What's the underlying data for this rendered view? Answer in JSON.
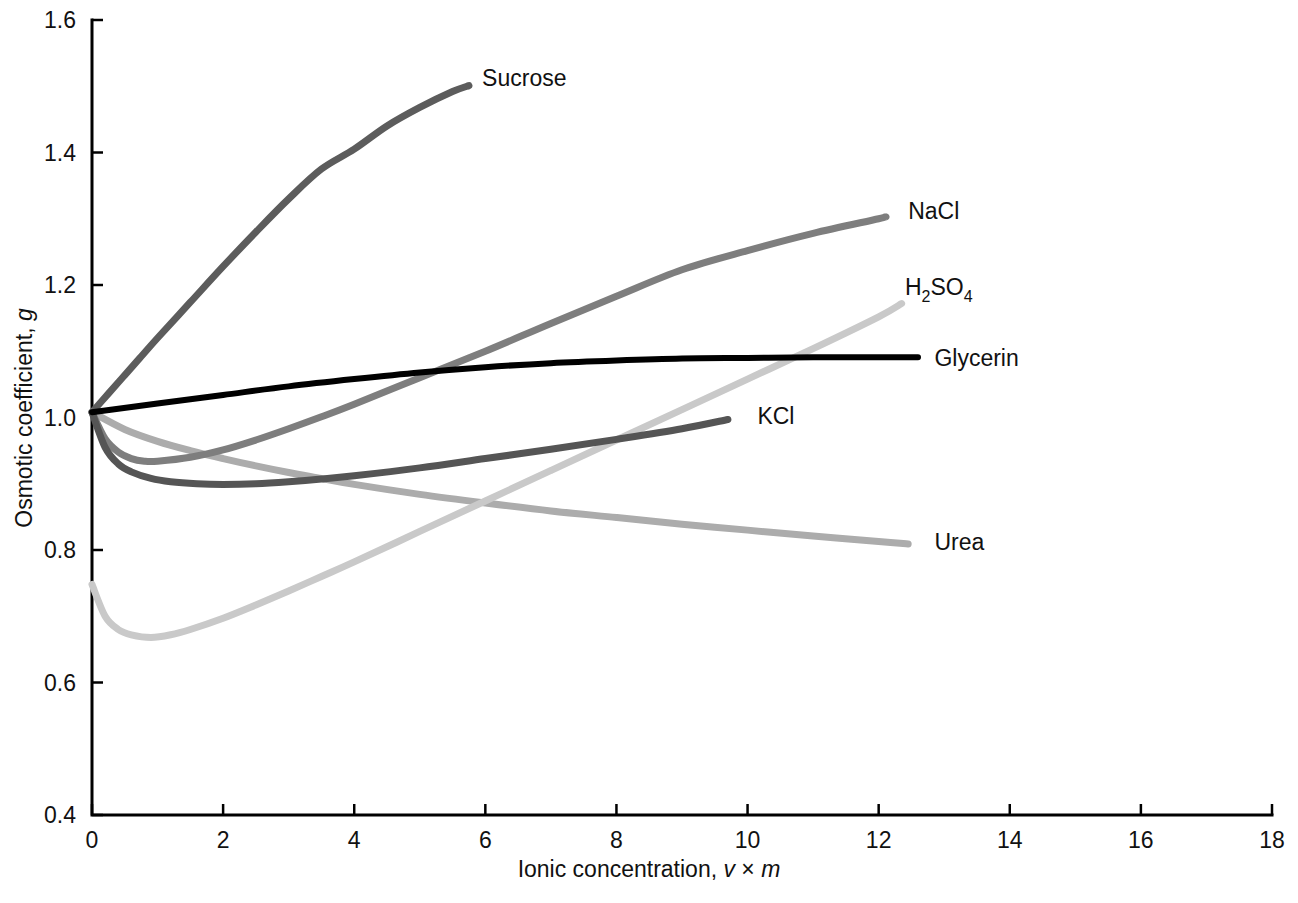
{
  "chart_data": {
    "type": "line",
    "title": "",
    "xlabel": "Ionic concentration, v × m",
    "ylabel": "Osmotic coefficient, g",
    "xlim": [
      0,
      18
    ],
    "ylim": [
      0.4,
      1.6
    ],
    "grid": false,
    "legend_position": "inline-end-of-curve",
    "xticks": [
      "0",
      "2",
      "4",
      "6",
      "8",
      "10",
      "12",
      "14",
      "16",
      "18"
    ],
    "xtick_values": [
      0,
      2,
      4,
      6,
      8,
      10,
      12,
      14,
      16,
      18
    ],
    "yticks": [
      "0.4",
      "0.6",
      "0.8",
      "1.0",
      "1.2",
      "1.4",
      "1.6"
    ],
    "ytick_values": [
      0.4,
      0.6,
      0.8,
      1.0,
      1.2,
      1.4,
      1.6
    ],
    "series": [
      {
        "name": "Sucrose",
        "label": "Sucrose",
        "color": "#5c5c5c",
        "width": 7,
        "label_x": 5.95,
        "label_y": 1.513,
        "points": [
          [
            0.0,
            1.008
          ],
          [
            0.25,
            1.036
          ],
          [
            0.5,
            1.064
          ],
          [
            0.75,
            1.092
          ],
          [
            1.0,
            1.12
          ],
          [
            1.5,
            1.174
          ],
          [
            2.0,
            1.228
          ],
          [
            2.5,
            1.28
          ],
          [
            3.0,
            1.33
          ],
          [
            3.5,
            1.375
          ],
          [
            4.0,
            1.405
          ],
          [
            4.5,
            1.44
          ],
          [
            5.0,
            1.468
          ],
          [
            5.5,
            1.492
          ],
          [
            5.75,
            1.501
          ]
        ]
      },
      {
        "name": "NaCl",
        "label": "NaCl",
        "color": "#7e7e7e",
        "width": 7,
        "label_x": 12.45,
        "label_y": 1.312,
        "points": [
          [
            0.0,
            1.008
          ],
          [
            0.2,
            0.968
          ],
          [
            0.4,
            0.948
          ],
          [
            0.6,
            0.938
          ],
          [
            0.8,
            0.934
          ],
          [
            1.0,
            0.934
          ],
          [
            1.5,
            0.94
          ],
          [
            2.0,
            0.951
          ],
          [
            2.5,
            0.966
          ],
          [
            3.0,
            0.983
          ],
          [
            3.5,
            1.001
          ],
          [
            4.0,
            1.02
          ],
          [
            5.0,
            1.06
          ],
          [
            6.0,
            1.1
          ],
          [
            7.0,
            1.142
          ],
          [
            8.0,
            1.183
          ],
          [
            9.0,
            1.223
          ],
          [
            10.0,
            1.252
          ],
          [
            11.0,
            1.278
          ],
          [
            12.0,
            1.3
          ],
          [
            12.1,
            1.303
          ]
        ]
      },
      {
        "name": "H2SO4",
        "label": "H₂SO₄",
        "color": "#c9c9c9",
        "width": 7,
        "label_x": 12.4,
        "label_y": 1.197,
        "points": [
          [
            0.0,
            0.748
          ],
          [
            0.2,
            0.7
          ],
          [
            0.4,
            0.68
          ],
          [
            0.6,
            0.672
          ],
          [
            0.9,
            0.668
          ],
          [
            1.2,
            0.672
          ],
          [
            1.5,
            0.68
          ],
          [
            2.0,
            0.697
          ],
          [
            2.5,
            0.717
          ],
          [
            3.0,
            0.738
          ],
          [
            3.5,
            0.76
          ],
          [
            4.0,
            0.782
          ],
          [
            5.0,
            0.828
          ],
          [
            6.0,
            0.874
          ],
          [
            7.0,
            0.92
          ],
          [
            8.0,
            0.966
          ],
          [
            9.0,
            1.012
          ],
          [
            10.0,
            1.058
          ],
          [
            11.0,
            1.104
          ],
          [
            12.0,
            1.152
          ],
          [
            12.35,
            1.172
          ]
        ]
      },
      {
        "name": "Glycerin",
        "label": "Glycerin",
        "color": "#000000",
        "width": 6,
        "label_x": 12.85,
        "label_y": 1.09,
        "points": [
          [
            0.0,
            1.008
          ],
          [
            1.0,
            1.021
          ],
          [
            2.0,
            1.034
          ],
          [
            3.0,
            1.047
          ],
          [
            4.0,
            1.058
          ],
          [
            5.0,
            1.068
          ],
          [
            6.0,
            1.076
          ],
          [
            7.0,
            1.082
          ],
          [
            8.0,
            1.086
          ],
          [
            9.0,
            1.089
          ],
          [
            10.0,
            1.09
          ],
          [
            11.0,
            1.091
          ],
          [
            12.0,
            1.091
          ],
          [
            12.6,
            1.091
          ]
        ]
      },
      {
        "name": "KCl",
        "label": "KCl",
        "color": "#555555",
        "width": 7,
        "label_x": 10.15,
        "label_y": 1.003,
        "points": [
          [
            0.0,
            1.008
          ],
          [
            0.2,
            0.955
          ],
          [
            0.4,
            0.93
          ],
          [
            0.6,
            0.918
          ],
          [
            0.9,
            0.908
          ],
          [
            1.2,
            0.903
          ],
          [
            1.6,
            0.9
          ],
          [
            2.0,
            0.899
          ],
          [
            2.5,
            0.9
          ],
          [
            3.0,
            0.903
          ],
          [
            3.5,
            0.907
          ],
          [
            4.0,
            0.912
          ],
          [
            5.0,
            0.924
          ],
          [
            6.0,
            0.938
          ],
          [
            7.0,
            0.952
          ],
          [
            8.0,
            0.967
          ],
          [
            9.0,
            0.983
          ],
          [
            9.7,
            0.997
          ]
        ]
      },
      {
        "name": "Urea",
        "label": "Urea",
        "color": "#acacac",
        "width": 7,
        "label_x": 12.85,
        "label_y": 0.812,
        "points": [
          [
            0.0,
            1.008
          ],
          [
            0.5,
            0.982
          ],
          [
            1.0,
            0.964
          ],
          [
            1.5,
            0.95
          ],
          [
            2.0,
            0.938
          ],
          [
            2.5,
            0.927
          ],
          [
            3.0,
            0.917
          ],
          [
            3.5,
            0.908
          ],
          [
            4.0,
            0.899
          ],
          [
            5.0,
            0.884
          ],
          [
            6.0,
            0.871
          ],
          [
            7.0,
            0.859
          ],
          [
            8.0,
            0.849
          ],
          [
            9.0,
            0.839
          ],
          [
            10.0,
            0.83
          ],
          [
            11.0,
            0.821
          ],
          [
            12.0,
            0.813
          ],
          [
            12.45,
            0.809
          ]
        ]
      }
    ]
  },
  "axes": {
    "x_label_prefix": "Ionic concentration, ",
    "x_label_v": "v",
    "x_label_times": " × ",
    "x_label_m": "m",
    "y_label_prefix": "Osmotic coefficient, ",
    "y_label_g": "g"
  },
  "labels": {
    "sucrose": "Sucrose",
    "nacl": "NaCl",
    "h2so4_main": "H",
    "h2so4_sub1": "2",
    "h2so4_mid": "SO",
    "h2so4_sub2": "4",
    "glycerin": "Glycerin",
    "kcl": "KCl",
    "urea": "Urea"
  }
}
